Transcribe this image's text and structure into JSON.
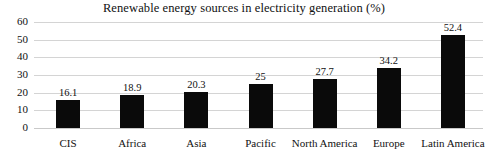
{
  "chart_data": {
    "type": "bar",
    "title": "Renewable energy sources in electricity generation (%)",
    "xlabel": "",
    "ylabel": "",
    "categories": [
      "CIS",
      "Africa",
      "Asia",
      "Pacific",
      "North America",
      "Europe",
      "Latin America"
    ],
    "values": [
      16.1,
      18.9,
      20.3,
      25,
      27.7,
      34.2,
      52.4
    ],
    "value_labels": [
      "16.1",
      "18.9",
      "20.3",
      "25",
      "27.7",
      "34.2",
      "52.4"
    ],
    "ylim": [
      0,
      60
    ],
    "yticks": [
      0,
      10,
      20,
      30,
      40,
      50,
      60
    ],
    "ytick_labels": [
      "0",
      "10",
      "20",
      "30",
      "40",
      "50",
      "60"
    ],
    "grid": true,
    "legend": false,
    "series": [
      {
        "name": "Renewable share",
        "values": [
          16.1,
          18.9,
          20.3,
          25,
          27.7,
          34.2,
          52.4
        ],
        "color": "#0a0a0a"
      }
    ],
    "colors": {
      "bar": "#0a0a0a",
      "gridline": "#d4d4d4",
      "background": "#ffffff",
      "text": "#111111"
    }
  }
}
